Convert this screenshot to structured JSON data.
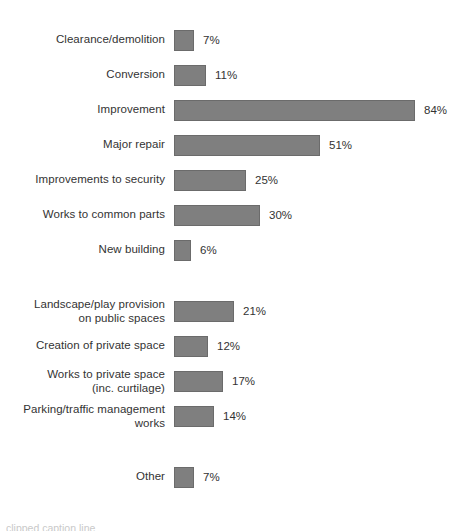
{
  "chart_data": {
    "type": "bar",
    "orientation": "horizontal",
    "title": "",
    "subtitle": "",
    "xlabel": "",
    "ylabel": "",
    "xlim": [
      0,
      100
    ],
    "grid": false,
    "legend": null,
    "value_suffix": "%",
    "categories": [
      "Clearance/demolition",
      "Conversion",
      "Improvement",
      "Major repair",
      "Improvements to security",
      "Works to common parts",
      "New building",
      "Landscape/play provision on public spaces",
      "Creation of private space",
      "Works to private space (inc. curtilage)",
      "Parking/traffic management works",
      "Other"
    ],
    "values": [
      7,
      11,
      84,
      51,
      25,
      30,
      6,
      21,
      12,
      17,
      14,
      7
    ],
    "groups": [
      {
        "name": "group-1",
        "bars": [
          {
            "label_lines": [
              "Clearance/demolition"
            ],
            "value": 7,
            "value_label": "7%"
          },
          {
            "label_lines": [
              "Conversion"
            ],
            "value": 11,
            "value_label": "11%"
          },
          {
            "label_lines": [
              "Improvement"
            ],
            "value": 84,
            "value_label": "84%"
          },
          {
            "label_lines": [
              "Major repair"
            ],
            "value": 51,
            "value_label": "51%"
          },
          {
            "label_lines": [
              "Improvements to security"
            ],
            "value": 25,
            "value_label": "25%"
          },
          {
            "label_lines": [
              "Works to common parts"
            ],
            "value": 30,
            "value_label": "30%"
          },
          {
            "label_lines": [
              "New building"
            ],
            "value": 6,
            "value_label": "6%"
          }
        ]
      },
      {
        "name": "group-2",
        "bars": [
          {
            "label_lines": [
              "Landscape/play provision",
              "on public spaces"
            ],
            "value": 21,
            "value_label": "21%"
          },
          {
            "label_lines": [
              "Creation of private space"
            ],
            "value": 12,
            "value_label": "12%"
          },
          {
            "label_lines": [
              "Works to private space",
              "(inc. curtilage)"
            ],
            "value": 17,
            "value_label": "17%"
          },
          {
            "label_lines": [
              "Parking/traffic management",
              "works"
            ],
            "value": 14,
            "value_label": "14%"
          }
        ]
      },
      {
        "name": "group-3",
        "bars": [
          {
            "label_lines": [
              "Other"
            ],
            "value": 7,
            "value_label": "7%"
          }
        ]
      }
    ]
  },
  "style": {
    "bar_color": "#7f7f7f",
    "bar_outline_color": "#6b6b6b",
    "text_color": "#333333",
    "background_color": "#ffffff"
  },
  "bottom_caption": {
    "text": "clipped caption line"
  }
}
